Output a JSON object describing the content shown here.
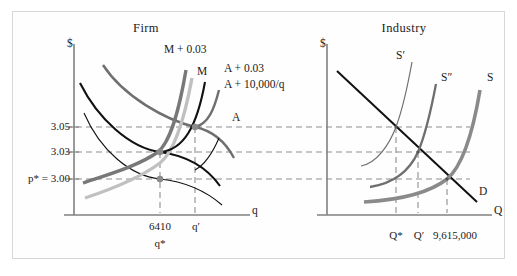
{
  "figure": {
    "width": 517,
    "height": 276,
    "background": "#ffffff",
    "border_color": "#d8d8d8"
  },
  "panels": {
    "firm": {
      "title": "Firm",
      "y_axis_label": "$",
      "x_axis_label": "q",
      "y_ticks": [
        {
          "label": "3.05",
          "value": 3.05
        },
        {
          "label": "3.03",
          "value": 3.03
        },
        {
          "label": "p* = 3.00",
          "value": 3.0
        }
      ],
      "x_ticks": [
        {
          "label": "6410",
          "sub_label": "q*"
        },
        {
          "label": "q′",
          "sub_label": ""
        }
      ],
      "curves": [
        {
          "name": "M + 0.03",
          "label": "M + 0.03",
          "color": "#777777",
          "width": 3.2,
          "kind": "marginal-cost-shifted"
        },
        {
          "name": "M",
          "label": "M",
          "color": "#b9b9b9",
          "width": 3.2,
          "kind": "marginal-cost"
        },
        {
          "name": "A + 0.03",
          "label": "A + 0.03",
          "color": "#111111",
          "width": 2.0,
          "kind": "average-cost-shifted"
        },
        {
          "name": "A + 10,000/q",
          "label": "A + 10,000/q",
          "color": "#6f6f6f",
          "width": 2.4,
          "kind": "average-cost-fixed-fee"
        },
        {
          "name": "A",
          "label": "A",
          "color": "#111111",
          "width": 1.1,
          "kind": "average-cost"
        }
      ],
      "equilibria": [
        {
          "label": "A + 0.03 minimum",
          "price": 3.03,
          "quantity": "6410"
        },
        {
          "label": "A minimum",
          "price": 3.0,
          "quantity": "6410"
        },
        {
          "label": "A + 10,000/q minimum",
          "price": 3.05,
          "quantity": "q′"
        }
      ]
    },
    "industry": {
      "title": "Industry",
      "y_axis_label": "$",
      "x_axis_label": "Q",
      "x_ticks": [
        {
          "label": "Q*"
        },
        {
          "label": "Q′"
        },
        {
          "label": "9,615,000"
        }
      ],
      "curves": [
        {
          "name": "S′",
          "label": "S′",
          "color": "#6f6f6f",
          "width": 1.1,
          "kind": "supply-shifted-left"
        },
        {
          "name": "S″",
          "label": "S″",
          "color": "#6f6f6f",
          "width": 2.2,
          "kind": "supply-middle"
        },
        {
          "name": "S",
          "label": "S",
          "color": "#8a8a8a",
          "width": 3.6,
          "kind": "supply"
        },
        {
          "name": "D",
          "label": "D",
          "color": "#111111",
          "width": 2.0,
          "kind": "demand"
        }
      ],
      "equilibria": [
        {
          "label": "S′ × D",
          "price": 3.05,
          "quantity": "Q*"
        },
        {
          "label": "S″ × D",
          "price": 3.03,
          "quantity": "Q′"
        },
        {
          "label": "S × D",
          "price": 3.0,
          "quantity": "9,615,000"
        }
      ]
    }
  },
  "colors": {
    "axis": "#808080",
    "dash": "#8e8e8e",
    "dot": "#8a8a8a",
    "text": "#1b1b1b"
  }
}
